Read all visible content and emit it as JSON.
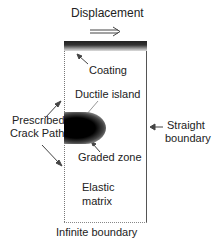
{
  "diagram": {
    "labels": {
      "displacement": "Displacement",
      "coating": "Coating",
      "ductile_island": "Ductile island",
      "prescribed_line1": "Prescribed",
      "prescribed_line2": "Crack Path",
      "straight_line1": "Straight",
      "straight_line2": "boundary",
      "graded_zone": "Graded zone",
      "elastic_line1": "Elastic",
      "elastic_line2": "matrix",
      "infinite_boundary": "Infinite boundary"
    },
    "icons": {
      "displacement_arrow": "double-right-arrow",
      "pointer_arrows": "thin-arrow"
    },
    "colors": {
      "coating": "#222222",
      "island": "#000000",
      "border": "#555555"
    }
  }
}
